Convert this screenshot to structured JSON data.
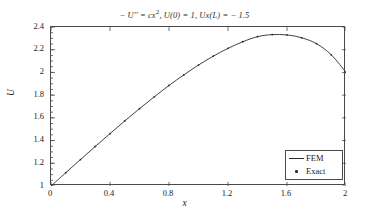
{
  "chart_data": {
    "type": "line",
    "title_parts": {
      "lhs": "− U'' = cx",
      "exponent": "2",
      "bc1": ", U(0) = 1, Ux(L) = − 1.5"
    },
    "xlabel": "x",
    "ylabel": "U",
    "xlim": [
      0,
      2
    ],
    "ylim": [
      1,
      2.4
    ],
    "grid": false,
    "legend_position": "lower right",
    "xticks": [
      "0",
      "0.4",
      "0.8",
      "1.2",
      "1.6",
      "2"
    ],
    "xtick_values": [
      0,
      0.4,
      0.8,
      1.2,
      1.6,
      2
    ],
    "yticks": [
      "1",
      "1.2",
      "1.4",
      "1.6",
      "1.8",
      "2",
      "2.2",
      "2.4"
    ],
    "ytick_values": [
      1,
      1.2,
      1.4,
      1.6,
      1.8,
      2,
      2.2,
      2.4
    ],
    "series": [
      {
        "name": "FEM",
        "style": "line",
        "color": "#2a2a2a",
        "x": [
          0,
          0.1,
          0.2,
          0.3,
          0.4,
          0.5,
          0.6,
          0.7,
          0.8,
          0.9,
          1.0,
          1.1,
          1.2,
          1.3,
          1.4,
          1.5,
          1.6,
          1.7,
          1.8,
          1.9,
          2.0
        ],
        "y": [
          1.0,
          1.117,
          1.233,
          1.348,
          1.461,
          1.573,
          1.681,
          1.785,
          1.885,
          1.978,
          2.065,
          2.143,
          2.212,
          2.27,
          2.315,
          2.333,
          2.33,
          2.305,
          2.253,
          2.155,
          2.0
        ]
      },
      {
        "name": "Exact",
        "style": "markers",
        "color": "#2a2a2a",
        "x": [
          0,
          0.1,
          0.2,
          0.3,
          0.4,
          0.5,
          0.6,
          0.7,
          0.8,
          0.9,
          1.0,
          1.1,
          1.2,
          1.3,
          1.4,
          1.5,
          1.6,
          1.7,
          1.8,
          1.9,
          2.0
        ],
        "y": [
          1.0,
          1.117,
          1.233,
          1.348,
          1.461,
          1.573,
          1.681,
          1.785,
          1.885,
          1.978,
          2.065,
          2.143,
          2.212,
          2.27,
          2.315,
          2.333,
          2.33,
          2.305,
          2.253,
          2.155,
          2.0
        ]
      }
    ],
    "legend": [
      {
        "label": "FEM",
        "marker": "line"
      },
      {
        "label": "Exact",
        "marker": "dot"
      }
    ]
  }
}
